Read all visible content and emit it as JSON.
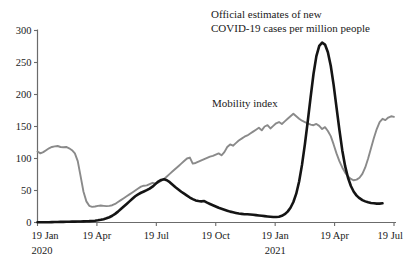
{
  "chart_data": {
    "type": "line",
    "title": "",
    "xlabel": "",
    "ylabel": "",
    "ylim": [
      0,
      300
    ],
    "yticks": [
      0,
      50,
      100,
      150,
      200,
      250,
      300
    ],
    "ytick_labels": [
      "0",
      "50",
      "100",
      "150",
      "200",
      "250",
      "300"
    ],
    "grid": false,
    "legend_position": "inline-annotations",
    "xtick_labels": [
      "19 Jan",
      "19 Apr",
      "19 Jul",
      "19 Oct",
      "19 Jan",
      "19 Apr",
      "19 Jul"
    ],
    "xtick_sublabels": [
      "2020",
      "",
      "",
      "",
      "2021",
      "",
      ""
    ],
    "x_range_description": "19 Jan 2020 to 19 Jul 2021, weekly observations",
    "annotations": [
      {
        "name": "covid-series-label",
        "lines": [
          "Official estimates of new",
          "COVID-19 cases per million people"
        ],
        "target_series": "Official estimates of new COVID-19 cases per million people"
      },
      {
        "name": "mobility-series-label",
        "lines": [
          "Mobility index"
        ],
        "target_series": "Mobility index"
      }
    ],
    "colors": {
      "covid": "#141414",
      "mobility": "#8a8a8a",
      "axis": "#6b6b6b",
      "text": "#1a1a1a",
      "background": "#ffffff"
    },
    "series": [
      {
        "name": "Official estimates of new COVID-19 cases per million people",
        "color": "#141414",
        "values": [
          0.3,
          0.3,
          0.4,
          0.4,
          0.5,
          0.6,
          0.7,
          0.8,
          0.9,
          1.0,
          1.1,
          1.2,
          1.3,
          1.4,
          1.5,
          1.6,
          1.7,
          1.9,
          2.1,
          2.4,
          2.8,
          3.4,
          4.2,
          5.2,
          6.5,
          8.2,
          10.5,
          13.5,
          17.0,
          21.0,
          25.0,
          29.0,
          33.0,
          37.0,
          41.0,
          44.0,
          46.5,
          48.5,
          50.5,
          53.0,
          56.0,
          60.0,
          64.0,
          66.5,
          67.5,
          66.0,
          63.0,
          59.0,
          55.0,
          51.5,
          48.0,
          45.0,
          42.0,
          39.0,
          36.5,
          34.5,
          33.5,
          33.0,
          33.5,
          31.0,
          29.0,
          27.0,
          25.0,
          23.0,
          21.5,
          20.0,
          18.5,
          17.0,
          16.0,
          15.0,
          14.0,
          13.5,
          13.0,
          13.0,
          12.5,
          12.0,
          11.5,
          11.0,
          10.5,
          10.0,
          9.5,
          9.0,
          8.5,
          8.5,
          9.0,
          10.5,
          13.0,
          17.0,
          23.0,
          32.0,
          45.0,
          64.0,
          90.0,
          122.0,
          158.0,
          196.0,
          232.0,
          260.0,
          276.0,
          281.0,
          278.0,
          266.0,
          245.0,
          215.0,
          180.0,
          145.0,
          113.0,
          88.0,
          70.0,
          57.0,
          48.0,
          42.0,
          38.0,
          35.0,
          33.0,
          31.5,
          30.5,
          30.0,
          29.5,
          29.5,
          30.0
        ]
      },
      {
        "name": "Mobility index",
        "color": "#8a8a8a",
        "values": [
          111.0,
          108.0,
          110.0,
          113.0,
          116.0,
          118.0,
          119.0,
          119.5,
          118.0,
          117.5,
          118.0,
          116.0,
          113.0,
          108.0,
          96.0,
          72.0,
          48.0,
          33.0,
          26.0,
          24.5,
          25.0,
          26.0,
          26.5,
          26.0,
          25.5,
          26.0,
          27.0,
          29.0,
          32.0,
          35.0,
          38.0,
          41.0,
          44.0,
          47.0,
          50.0,
          53.0,
          56.0,
          57.5,
          58.0,
          60.0,
          62.0,
          61.0,
          62.5,
          65.0,
          68.0,
          72.0,
          76.0,
          80.0,
          84.0,
          88.0,
          92.0,
          96.0,
          100.0,
          101.5,
          92.0,
          93.0,
          95.0,
          97.0,
          99.0,
          101.0,
          103.0,
          104.0,
          106.0,
          108.0,
          105.0,
          110.0,
          118.0,
          122.0,
          120.0,
          124.0,
          128.0,
          131.0,
          134.0,
          136.0,
          139.0,
          142.0,
          145.0,
          148.0,
          144.0,
          150.0,
          152.0,
          147.0,
          151.0,
          155.0,
          157.0,
          154.0,
          158.0,
          162.0,
          166.0,
          170.0,
          166.0,
          162.0,
          159.0,
          157.0,
          155.0,
          153.0,
          152.0,
          154.0,
          151.0,
          146.0,
          149.0,
          143.0,
          135.0,
          122.0,
          108.0,
          96.0,
          86.0,
          78.0,
          72.0,
          68.0,
          66.0,
          67.0,
          70.0,
          76.0,
          86.0,
          100.0,
          116.0,
          132.0,
          146.0,
          157.0,
          162.0,
          160.0,
          164.0,
          166.0,
          165.0
        ]
      }
    ]
  }
}
